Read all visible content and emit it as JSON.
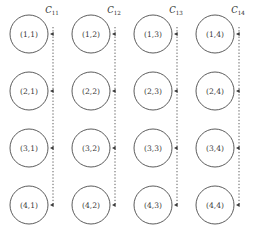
{
  "figure": {
    "type": "grid-bus-diagram",
    "grid": {
      "rows": 4,
      "cols": 4,
      "nodes": [
        [
          {
            "label": "(1,1)",
            "row": 1,
            "col": 1
          },
          {
            "label": "(1,2)",
            "row": 1,
            "col": 2
          },
          {
            "label": "(1,3)",
            "row": 1,
            "col": 3
          },
          {
            "label": "(1,4)",
            "row": 1,
            "col": 4
          }
        ],
        [
          {
            "label": "(2,1)",
            "row": 2,
            "col": 1
          },
          {
            "label": "(2,2)",
            "row": 2,
            "col": 2
          },
          {
            "label": "(2,3)",
            "row": 2,
            "col": 3
          },
          {
            "label": "(2,4)",
            "row": 2,
            "col": 4
          }
        ],
        [
          {
            "label": "(3,1)",
            "row": 3,
            "col": 1
          },
          {
            "label": "(3,2)",
            "row": 3,
            "col": 2
          },
          {
            "label": "(3,3)",
            "row": 3,
            "col": 3
          },
          {
            "label": "(3,4)",
            "row": 3,
            "col": 4
          }
        ],
        [
          {
            "label": "(4,1)",
            "row": 4,
            "col": 1
          },
          {
            "label": "(4,2)",
            "row": 4,
            "col": 2
          },
          {
            "label": "(4,3)",
            "row": 4,
            "col": 3
          },
          {
            "label": "(4,4)",
            "row": 4,
            "col": 4
          }
        ]
      ]
    },
    "buses": [
      {
        "symbol": "C",
        "subscript": "11",
        "column": 1
      },
      {
        "symbol": "C",
        "subscript": "12",
        "column": 2
      },
      {
        "symbol": "C",
        "subscript": "13",
        "column": 3
      },
      {
        "symbol": "C",
        "subscript": "14",
        "column": 4
      }
    ],
    "colors": {
      "background": "#ffffff",
      "stroke": "#4a4a4a",
      "text": "#3a3a3a",
      "label": "#2e2e2e"
    },
    "geometry": {
      "col_x": [
        29,
        91,
        153,
        215
      ],
      "row_y": [
        34,
        91,
        148,
        205
      ],
      "radius": 19,
      "bus_x": [
        53,
        115,
        177,
        239
      ],
      "bus_top_y": 27,
      "bus_bottom_y": 205,
      "label_y": 13
    }
  }
}
